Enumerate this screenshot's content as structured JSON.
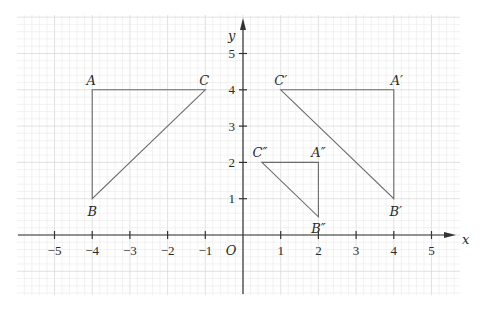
{
  "diagram": {
    "axes": {
      "x_label": "x",
      "y_label": "y",
      "origin_label": "O",
      "x_ticks": [
        {
          "value": -5,
          "label": "−5"
        },
        {
          "value": -4,
          "label": "−4"
        },
        {
          "value": -3,
          "label": "−3"
        },
        {
          "value": -2,
          "label": "−2"
        },
        {
          "value": -1,
          "label": "−1"
        },
        {
          "value": 1,
          "label": "1"
        },
        {
          "value": 2,
          "label": "2"
        },
        {
          "value": 3,
          "label": "3"
        },
        {
          "value": 4,
          "label": "4"
        },
        {
          "value": 5,
          "label": "5"
        }
      ],
      "y_ticks": [
        {
          "value": 1,
          "label": "1"
        },
        {
          "value": 2,
          "label": "2"
        },
        {
          "value": 3,
          "label": "3"
        },
        {
          "value": 4,
          "label": "4"
        },
        {
          "value": 5,
          "label": "5"
        }
      ],
      "x_range": [
        -6,
        6
      ],
      "y_range": [
        -1.6,
        6
      ],
      "grid": true
    },
    "triangles": [
      {
        "name": "ABC",
        "vertices": [
          {
            "label": "A",
            "x": -4,
            "y": 4
          },
          {
            "label": "B",
            "x": -4,
            "y": 1
          },
          {
            "label": "C",
            "x": -1,
            "y": 4
          }
        ]
      },
      {
        "name": "A'B'C'",
        "vertices": [
          {
            "label": "A′",
            "x": 4,
            "y": 4
          },
          {
            "label": "B′",
            "x": 4,
            "y": 1
          },
          {
            "label": "C′",
            "x": 1,
            "y": 4
          }
        ]
      },
      {
        "name": "A''B''C''",
        "vertices": [
          {
            "label": "A″",
            "x": 2,
            "y": 2
          },
          {
            "label": "B″",
            "x": 2,
            "y": 0.5
          },
          {
            "label": "C″",
            "x": 0.5,
            "y": 2
          }
        ]
      }
    ],
    "colors": {
      "axis": "#333333",
      "triangle_stroke": "#6a6a6a",
      "grid_major": "#d9d9d9",
      "grid_minor": "#e9e9e9",
      "text": "#2a2a2a"
    }
  }
}
